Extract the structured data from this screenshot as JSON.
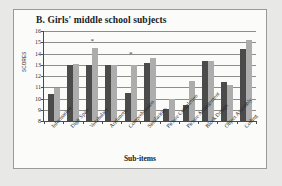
{
  "figure": {
    "title": "B. Girls' middle school subjects"
  },
  "chart_data": {
    "type": "bar",
    "title": "B. Girls' middle school subjects",
    "xlabel": "Sub-items",
    "ylabel": "SCORES",
    "ylim": [
      8,
      16
    ],
    "yticks": [
      8,
      9,
      10,
      11,
      12,
      13,
      14,
      15,
      16
    ],
    "grid": true,
    "legend": "none",
    "categories": [
      "Information",
      "Digit Span",
      "Vocabulary",
      "Arithmetic",
      "Comprehension",
      "Similarities",
      "Picture Completion",
      "Picture Arrangement",
      "Block Design",
      "Object Assembly",
      "Coding"
    ],
    "series": [
      {
        "name": "dark",
        "color": "#4b4b4b",
        "values": [
          10.4,
          13.0,
          13.0,
          13.0,
          10.5,
          13.2,
          9.05,
          9.4,
          13.3,
          11.5,
          14.4
        ]
      },
      {
        "name": "light",
        "color": "#adadad",
        "values": [
          10.9,
          13.1,
          14.5,
          13.0,
          13.0,
          13.6,
          10.0,
          11.6,
          13.3,
          11.2,
          15.2
        ]
      }
    ],
    "annotations": [
      {
        "label": "*",
        "category": "Vocabulary",
        "value": 15.4
      },
      {
        "label": "*",
        "category": "Comprehension",
        "value": 14.2
      }
    ]
  }
}
